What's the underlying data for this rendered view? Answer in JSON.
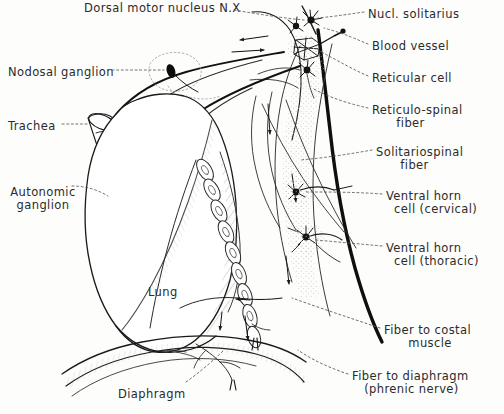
{
  "figure": {
    "title": "Dorsal motor nucleus N.X",
    "background_color": "#fdfdfc",
    "ink_color": "#1a1a1a",
    "leader_color": "#555555"
  },
  "labels_left": [
    {
      "id": "nodosal-ganglion",
      "text": "Nodosal ganglion",
      "x": 8,
      "y": 66
    },
    {
      "id": "trachea",
      "text": "Trachea",
      "x": 8,
      "y": 120
    },
    {
      "id": "autonomic-ganglion",
      "text": "Autonomic\nganglion",
      "x": 8,
      "y": 186
    }
  ],
  "labels_inner": [
    {
      "id": "lung",
      "text": "Lung",
      "x": 148,
      "y": 286
    },
    {
      "id": "diaphragm",
      "text": "Diaphragm",
      "x": 118,
      "y": 388
    }
  ],
  "labels_right": [
    {
      "id": "nucl-solitarius",
      "text": "Nucl. solitarius",
      "x": 368,
      "y": 8
    },
    {
      "id": "blood-vessel",
      "text": "Blood vessel",
      "x": 372,
      "y": 40
    },
    {
      "id": "reticular-cell",
      "text": "Reticular cell",
      "x": 372,
      "y": 72
    },
    {
      "id": "reticulo-spinal-fiber",
      "text": "Reticulo-spinal\n      fiber",
      "x": 372,
      "y": 104
    },
    {
      "id": "solitariospinal-fiber",
      "text": "Solitariospinal\n      fiber",
      "x": 376,
      "y": 146
    },
    {
      "id": "ventral-horn-cell-cervical",
      "text": "Ventral horn\n  cell (cervical)",
      "x": 386,
      "y": 190
    },
    {
      "id": "ventral-horn-cell-thoracic",
      "text": "Ventral horn\n  cell (thoracic)",
      "x": 386,
      "y": 242
    },
    {
      "id": "fiber-to-costal-muscle",
      "text": "Fiber to costal\n      muscle",
      "x": 384,
      "y": 324
    },
    {
      "id": "fiber-to-diaphragm",
      "text": "Fiber to diaphragm\n   (phrenic nerve)",
      "x": 352,
      "y": 370
    }
  ],
  "structures": [
    {
      "id": "spinal-cord",
      "name": "spinal-cord-outline"
    },
    {
      "id": "medulla",
      "name": "medulla-outline"
    },
    {
      "id": "vagus-nerve",
      "name": "vagus-nerve-trunk"
    },
    {
      "id": "lung-body",
      "name": "lung-outline"
    },
    {
      "id": "diaphragm-body",
      "name": "diaphragm-muscle"
    },
    {
      "id": "trachea-tube",
      "name": "trachea-tube"
    },
    {
      "id": "vertebral-chain",
      "name": "vertebral-column-chain"
    },
    {
      "id": "nodosal-ganglion-dot",
      "name": "nodosal-ganglion-marker"
    },
    {
      "id": "autonomic-ganglion-dot",
      "name": "autonomic-ganglion-marker"
    },
    {
      "id": "neuron-cluster-solitarius",
      "name": "neuron-cluster"
    },
    {
      "id": "neuron-cluster-reticular",
      "name": "neuron-cluster"
    },
    {
      "id": "neuron-cluster-cervical",
      "name": "neuron-cluster"
    },
    {
      "id": "neuron-cluster-thoracic",
      "name": "neuron-cluster"
    }
  ]
}
